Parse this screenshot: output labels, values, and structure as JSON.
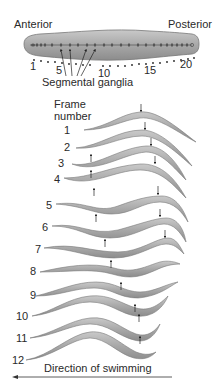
{
  "figure": {
    "top_labels": {
      "anterior": "Anterior",
      "posterior": "Posterior",
      "segmental_ganglia": "Segmental ganglia"
    },
    "segment_numbers": [
      "1",
      "5",
      "10",
      "15",
      "20"
    ],
    "frame_header": {
      "line1": "Frame",
      "line2": "number"
    },
    "frames": [
      "1",
      "2",
      "3",
      "4",
      "5",
      "6",
      "7",
      "8",
      "9",
      "10",
      "11",
      "12"
    ],
    "direction_label": "Direction of swimming",
    "colors": {
      "body_fill": "#9a9a9a",
      "body_stroke": "#6e6e6e",
      "text": "#2a2a2a",
      "arrow": "#222222"
    }
  }
}
